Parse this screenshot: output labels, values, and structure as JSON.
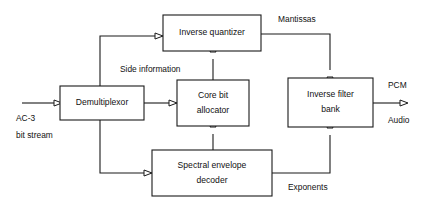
{
  "diagram": {
    "background_color": "#ffffff",
    "line_color": "#1a1a1a",
    "text_color": "#111111",
    "blocks": [
      {
        "id": "inverse-quantizer",
        "label_lines": [
          "Inverse quantizer"
        ],
        "x": 163,
        "y": 15,
        "w": 98,
        "h": 36
      },
      {
        "id": "demultiplexor",
        "label_lines": [
          "Demultiplexor"
        ],
        "x": 60,
        "y": 86,
        "w": 84,
        "h": 34
      },
      {
        "id": "core-bit-allocator",
        "label_lines": [
          "Core bit",
          "allocator"
        ],
        "x": 177,
        "y": 80,
        "w": 72,
        "h": 46
      },
      {
        "id": "inverse-filter-bank",
        "label_lines": [
          "Inverse filter",
          "bank"
        ],
        "x": 288,
        "y": 78,
        "w": 85,
        "h": 49
      },
      {
        "id": "spectral-envelope-decoder",
        "label_lines": [
          "Spectral envelope",
          "decoder"
        ],
        "x": 152,
        "y": 150,
        "w": 120,
        "h": 46
      }
    ],
    "edge_labels": [
      {
        "id": "mantissas",
        "text": "Mantissas",
        "x": 278,
        "y": 20,
        "anchor": "start"
      },
      {
        "id": "side-information",
        "text": "Side information",
        "x": 120,
        "y": 70,
        "anchor": "start"
      },
      {
        "id": "exponents",
        "text": "Exponents",
        "x": 288,
        "y": 188,
        "anchor": "start"
      },
      {
        "id": "input-label-line1",
        "text": "AC-3",
        "x": 16,
        "y": 119,
        "anchor": "start"
      },
      {
        "id": "input-label-line2",
        "text": "bit stream",
        "x": 16,
        "y": 136,
        "anchor": "start"
      },
      {
        "id": "output-label-line1",
        "text": "PCM",
        "x": 388,
        "y": 86,
        "anchor": "start"
      },
      {
        "id": "output-label-line2",
        "text": "Audio",
        "x": 388,
        "y": 121,
        "anchor": "start"
      }
    ],
    "connections": [
      {
        "id": "input-to-demux",
        "from": "ac3-bit-stream-input",
        "to": "demultiplexor",
        "path": "M 22 103 L 54 103"
      },
      {
        "id": "demux-to-inverse-quantizer",
        "from": "demultiplexor",
        "to": "inverse-quantizer",
        "path": "M 100 86 L 100 36 L 155 36"
      },
      {
        "id": "demux-to-core-bit-allocator",
        "from": "demultiplexor",
        "to": "core-bit-allocator",
        "path": "M 144 103 L 169 103"
      },
      {
        "id": "demux-to-spectral-decoder",
        "from": "demultiplexor",
        "to": "spectral-envelope-decoder",
        "path": "M 100 120 L 100 173 L 144 173"
      },
      {
        "id": "core-allocator-to-quantizer",
        "from": "core-bit-allocator",
        "to": "inverse-quantizer",
        "path": "M 213 80 L 213 59"
      },
      {
        "id": "spectral-decoder-to-core-allocator",
        "from": "spectral-envelope-decoder",
        "to": "core-bit-allocator",
        "path": "M 213 150 L 213 134"
      },
      {
        "id": "quantizer-mantissas-to-filter-bank",
        "from": "inverse-quantizer",
        "to": "inverse-filter-bank",
        "path": "M 261 34 L 330 34 L 330 70"
      },
      {
        "id": "spectral-decoder-exponents-to-filter-bank",
        "from": "spectral-envelope-decoder",
        "to": "inverse-filter-bank",
        "path": "M 272 173 L 330 173 L 330 135"
      },
      {
        "id": "filter-bank-to-output",
        "from": "inverse-filter-bank",
        "to": "pcm-audio-output",
        "path": "M 373 103 L 400 103"
      }
    ],
    "arrowheads": [
      {
        "id": "arrow-into-demultiplexor",
        "dir": "right",
        "x": 54,
        "y": 103
      },
      {
        "id": "arrow-into-inverse-quantizer-left",
        "dir": "right",
        "x": 155,
        "y": 36
      },
      {
        "id": "arrow-into-core-bit-allocator-left",
        "dir": "right",
        "x": 169,
        "y": 103
      },
      {
        "id": "arrow-into-spectral-decoder-left",
        "dir": "right",
        "x": 144,
        "y": 173
      },
      {
        "id": "arrow-into-inverse-quantizer-bottom",
        "dir": "up",
        "x": 213,
        "y": 52
      },
      {
        "id": "arrow-into-core-bit-allocator-bottom",
        "dir": "up",
        "x": 213,
        "y": 127
      },
      {
        "id": "arrow-into-filter-bank-top",
        "dir": "down",
        "x": 330,
        "y": 77
      },
      {
        "id": "arrow-into-filter-bank-bottom",
        "dir": "up",
        "x": 330,
        "y": 128
      },
      {
        "id": "arrow-pcm-audio-output",
        "dir": "right",
        "x": 400,
        "y": 103
      }
    ]
  }
}
